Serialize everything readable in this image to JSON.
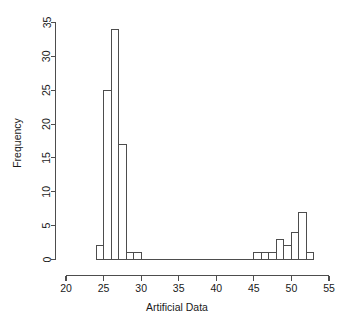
{
  "chart_data": {
    "type": "bar",
    "subtype": "histogram",
    "title": "",
    "xlabel": "Artificial Data",
    "ylabel": "Frequency",
    "xlim": [
      20,
      55
    ],
    "ylim": [
      0,
      35
    ],
    "xticks": [
      20,
      25,
      30,
      35,
      40,
      45,
      50,
      55
    ],
    "xtick_labels": [
      "20",
      "25",
      "30",
      "35",
      "40",
      "45",
      "50",
      "55"
    ],
    "yticks": [
      0,
      5,
      10,
      15,
      20,
      25,
      30,
      35
    ],
    "ytick_labels": [
      "0",
      "5",
      "10",
      "15",
      "20",
      "25",
      "30",
      "35"
    ],
    "grid": false,
    "legend": false,
    "bin_width": 1,
    "bin_edges": [
      24,
      25,
      26,
      27,
      28,
      29,
      30,
      45,
      46,
      47,
      48,
      49,
      50,
      51,
      52,
      53
    ],
    "bins": [
      {
        "x0": 24,
        "x1": 25,
        "count": 2
      },
      {
        "x0": 25,
        "x1": 26,
        "count": 25
      },
      {
        "x0": 26,
        "x1": 27,
        "count": 34
      },
      {
        "x0": 27,
        "x1": 28,
        "count": 17
      },
      {
        "x0": 28,
        "x1": 29,
        "count": 1
      },
      {
        "x0": 29,
        "x1": 30,
        "count": 1
      },
      {
        "x0": 45,
        "x1": 46,
        "count": 1
      },
      {
        "x0": 46,
        "x1": 47,
        "count": 1
      },
      {
        "x0": 47,
        "x1": 48,
        "count": 1
      },
      {
        "x0": 48,
        "x1": 49,
        "count": 3
      },
      {
        "x0": 49,
        "x1": 50,
        "count": 2
      },
      {
        "x0": 50,
        "x1": 51,
        "count": 4
      },
      {
        "x0": 51,
        "x1": 52,
        "count": 7
      },
      {
        "x0": 52,
        "x1": 53,
        "count": 1
      }
    ],
    "categories": [
      "24-25",
      "25-26",
      "26-27",
      "27-28",
      "28-29",
      "29-30",
      "45-46",
      "46-47",
      "47-48",
      "48-49",
      "49-50",
      "50-51",
      "51-52",
      "52-53"
    ],
    "values": [
      2,
      25,
      34,
      17,
      1,
      1,
      1,
      1,
      1,
      3,
      2,
      4,
      7,
      1
    ],
    "total_count": 100,
    "colors": {
      "bar_fill": "#ffffff",
      "bar_stroke": "#4d4d4d",
      "axis": "#4d4d4d",
      "text": "#1a1a1a",
      "background": "#ffffff"
    }
  }
}
